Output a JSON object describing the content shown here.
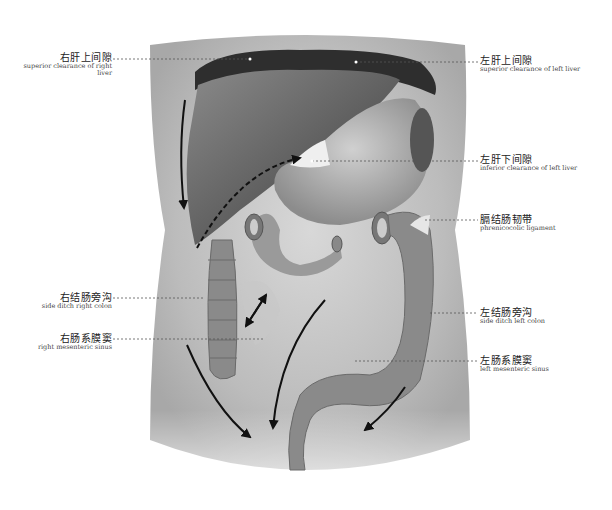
{
  "labels": {
    "superior_right_liver": {
      "zh": "右肝上间隙",
      "en": "superior clearance of right liver"
    },
    "superior_left_liver": {
      "zh": "左肝上间隙",
      "en": "superior clearance of left liver"
    },
    "inferior_left_liver": {
      "zh": "左肝下间隙",
      "en": "inferior  clearance of left liver"
    },
    "phrenicocolic": {
      "zh": "膈结肠韧带",
      "en": "phrenicocolic ligament"
    },
    "side_ditch_right": {
      "zh": "右结肠旁沟",
      "en": "side ditch right colon"
    },
    "right_mesenteric": {
      "zh": "右肠系膜窦",
      "en": "right mesenteric sinus"
    },
    "side_ditch_left": {
      "zh": "左结肠旁沟",
      "en": "side ditch left colon"
    },
    "left_mesenteric": {
      "zh": "左肠系膜窦",
      "en": "left mesenteric sinus"
    }
  },
  "colors": {
    "body": "#bdbdbd",
    "liver": "#6e6e6e",
    "colon": "#8a8a8a",
    "arrow": "#111111",
    "leader": "#555555"
  }
}
